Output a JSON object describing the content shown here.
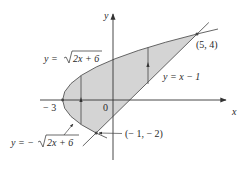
{
  "diagram": {
    "type": "region-between-curves",
    "axes": {
      "x_label": "x",
      "y_label": "y",
      "origin_label": "0",
      "tick_label_neg3": "− 3"
    },
    "curves": [
      {
        "id": "upper-parabola",
        "label_lhs": "y =",
        "label_rad": "2x + 6",
        "equation": "y = √(2x + 6)"
      },
      {
        "id": "lower-parabola",
        "label_lhs": "y = −",
        "label_rad": "2x + 6",
        "equation": "y = −√(2x + 6)"
      },
      {
        "id": "line",
        "label": "y = x − 1",
        "equation": "y = x − 1"
      }
    ],
    "points": [
      {
        "id": "intersection-top",
        "label": "(5, 4)",
        "x": 5,
        "y": 4
      },
      {
        "id": "intersection-bottom",
        "label": "(− 1, − 2)",
        "x": -1,
        "y": -2
      },
      {
        "id": "vertex",
        "label": "− 3",
        "x": -3,
        "y": 0
      }
    ],
    "region": {
      "description": "Region bounded by y = ±√(2x+6) and y = x − 1",
      "fill": "#d4d4d4"
    },
    "colors": {
      "fill": "#d4d4d4",
      "stroke": "#555555",
      "text": "#2a2a2a"
    }
  }
}
